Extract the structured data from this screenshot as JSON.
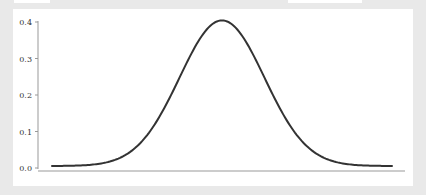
{
  "window": {
    "background": "#e9e9e9",
    "panel_background": "#ffffff"
  },
  "top_boxes": [
    {
      "left": 14,
      "width": 36
    },
    {
      "left": 288,
      "width": 74
    }
  ],
  "chart_data": {
    "type": "line",
    "title": "",
    "xlabel": "",
    "ylabel": "",
    "ylim": [
      0.0,
      0.4
    ],
    "yticks": [
      "0.0",
      "0.1",
      "0.2",
      "0.3",
      "0.4"
    ],
    "xticks": [],
    "grid": false,
    "legend": null,
    "line_color": "#333333",
    "series": [
      {
        "name": "normal pdf",
        "x": [
          -4.0,
          -3.5,
          -3.0,
          -2.5,
          -2.0,
          -1.5,
          -1.0,
          -0.5,
          0.0,
          0.5,
          1.0,
          1.5,
          2.0,
          2.5,
          3.0,
          3.5,
          4.0
        ],
        "values": [
          0.0001,
          0.0009,
          0.0044,
          0.0175,
          0.054,
          0.1295,
          0.242,
          0.3521,
          0.3989,
          0.3521,
          0.242,
          0.1295,
          0.054,
          0.0175,
          0.0044,
          0.0009,
          0.0001
        ]
      }
    ],
    "annotations": []
  }
}
